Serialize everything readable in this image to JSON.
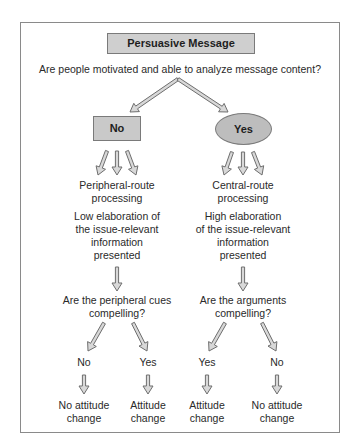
{
  "title": "Persuasive Message",
  "question": "Are people motivated and able to analyze message content?",
  "colors": {
    "node_fill": "#c9c9c9",
    "node_border": "#7a7a7a",
    "arrow_stroke": "#6e6e6e",
    "arrow_fill": "#d8d8d8",
    "frame": "#8a8a8a"
  },
  "left_branch": {
    "node": "No",
    "route": [
      "Peripheral-route",
      "processing"
    ],
    "elaboration": [
      "Low elaboration of",
      "the issue-relevant",
      "information",
      "presented"
    ],
    "question": [
      "Are the peripheral cues",
      "compelling?"
    ],
    "outcomes": [
      {
        "answer": "No",
        "result": [
          "No attitude",
          "change"
        ]
      },
      {
        "answer": "Yes",
        "result": [
          "Attitude",
          "change"
        ]
      }
    ]
  },
  "right_branch": {
    "node": "Yes",
    "route": [
      "Central-route",
      "processing"
    ],
    "elaboration": [
      "High elaboration",
      "of the issue-relevant",
      "information",
      "presented"
    ],
    "question": [
      "Are the arguments",
      "compelling?"
    ],
    "outcomes": [
      {
        "answer": "Yes",
        "result": [
          "Attitude",
          "change"
        ]
      },
      {
        "answer": "No",
        "result": [
          "No attitude",
          "change"
        ]
      }
    ]
  }
}
